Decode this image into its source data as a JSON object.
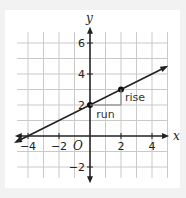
{
  "chart_data": {
    "type": "line",
    "title": "",
    "xlabel": "x",
    "ylabel": "y",
    "origin_label": "O",
    "xlim": [
      -4.5,
      4.5
    ],
    "ylim": [
      -3,
      7
    ],
    "grid": true,
    "x_ticks": [
      -4,
      -2,
      2,
      4
    ],
    "x_tick_labels": [
      "−4",
      "−2",
      "2",
      "4"
    ],
    "y_ticks": [
      -2,
      2,
      4,
      6
    ],
    "y_tick_labels": [
      "−2",
      "2",
      "4",
      "6"
    ],
    "series": [
      {
        "name": "line",
        "equation": "y = 0.5x + 2",
        "slope": 0.5,
        "intercept": 2,
        "x": [
          -4.5,
          4.5
        ],
        "y": [
          -0.25,
          4.25
        ]
      }
    ],
    "points": [
      {
        "x": 0,
        "y": 2
      },
      {
        "x": 2,
        "y": 3
      }
    ],
    "annotations": [
      {
        "text": "run",
        "from": [
          0,
          2
        ],
        "to": [
          2,
          2
        ]
      },
      {
        "text": "rise",
        "from": [
          2,
          2
        ],
        "to": [
          2,
          3
        ]
      }
    ]
  }
}
